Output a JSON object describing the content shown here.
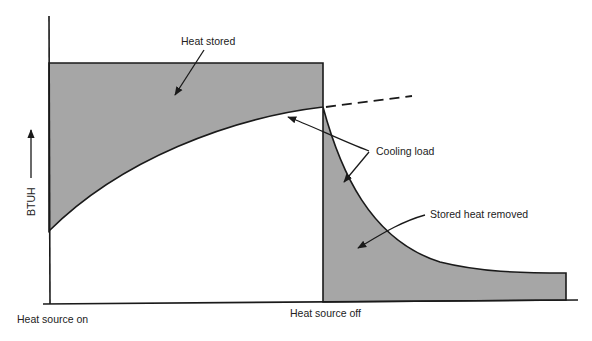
{
  "diagram": {
    "labels": {
      "heat_stored": "Heat stored",
      "cooling_load": "Cooling load",
      "stored_heat_removed": "Stored heat removed",
      "y_axis": "BTUH",
      "heat_source_on": "Heat source on",
      "heat_source_off": "Heat source off"
    },
    "colors": {
      "fill": "#a6a6a6",
      "line": "#1a1a1a",
      "background": "#ffffff"
    }
  }
}
